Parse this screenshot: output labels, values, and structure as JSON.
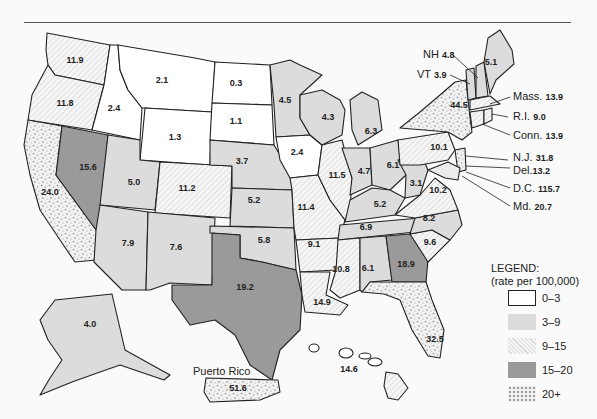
{
  "map": {
    "type": "choropleth",
    "region": "United States",
    "classes": [
      {
        "range": "0–3",
        "fill": "#ffffff",
        "pattern": "none"
      },
      {
        "range": "3–9",
        "fill": "#dcdcdc",
        "pattern": "solid-light"
      },
      {
        "range": "9–15",
        "fill": "#f2f2f2",
        "pattern": "diagonal-hatch"
      },
      {
        "range": "15–20",
        "fill": "#9a9a9a",
        "pattern": "solid-dark"
      },
      {
        "range": "20+",
        "fill": "#ececec",
        "pattern": "stipple"
      }
    ]
  },
  "legend": {
    "title": "LEGEND:",
    "subtitle": "(rate per 100,000)",
    "items": [
      "0–3",
      "3–9",
      "9–15",
      "15–20",
      "20+"
    ]
  },
  "states": {
    "WA": "11.9",
    "OR": "11.8",
    "CA": "24.0",
    "NV": "15.6",
    "ID": "2.4",
    "MT": "2.1",
    "WY": "1.3",
    "UT": "5.0",
    "CO": "11.2",
    "AZ": "7.9",
    "NM": "7.6",
    "ND": "0.3",
    "SD": "1.1",
    "NE": "3.7",
    "KS": "5.2",
    "OK": "5.8",
    "TX": "19.2",
    "MN": "4.5",
    "IA": "2.4",
    "MO": "11.4",
    "AR": "9.1",
    "LA": "14.9",
    "WI": "4.3",
    "IL": "11.5",
    "MI": "6.3",
    "IN": "4.7",
    "OH": "6.1",
    "KY": "5.2",
    "TN": "6.9",
    "MS": "10.8",
    "AL": "6.1",
    "GA": "18.9",
    "FL": "32.5",
    "SC": "9.6",
    "NC": "8.2",
    "VA": "10.2",
    "WV": "3.1",
    "PA": "10.1",
    "NY": "44.5",
    "ME": "5.1",
    "AK": "4.0",
    "HI": "14.6"
  },
  "callouts": [
    {
      "label": "NH",
      "value": "4.8"
    },
    {
      "label": "VT",
      "value": "3.9"
    },
    {
      "label": "Mass.",
      "value": "13.9"
    },
    {
      "label": "R.I.",
      "value": "9.0"
    },
    {
      "label": "Conn.",
      "value": "13.9"
    },
    {
      "label": "N.J.",
      "value": "31.8"
    },
    {
      "label": "Del.",
      "value": "13.2"
    },
    {
      "label": "D.C.",
      "value": "115.7"
    },
    {
      "label": "Md.",
      "value": "20.7"
    }
  ],
  "puerto_rico": {
    "label": "Puerto Rico",
    "value": "51.6"
  }
}
